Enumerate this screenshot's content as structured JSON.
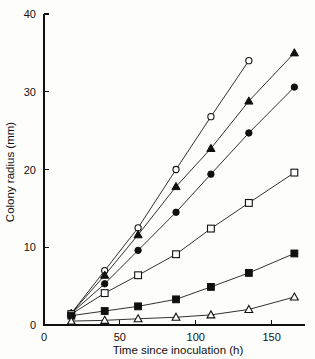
{
  "chart_data": {
    "type": "line",
    "title": "",
    "xlabel": "Time since inoculation (h)",
    "ylabel": "Colony radius (mm)",
    "xlim": [
      0,
      172
    ],
    "ylim": [
      0,
      40
    ],
    "xticks": [
      0,
      50,
      100,
      150
    ],
    "yticks": [
      0,
      10,
      20,
      30,
      40
    ],
    "grid": false,
    "legend": "none",
    "series": [
      {
        "name": "open-circle",
        "marker": "open-circle",
        "x": [
          18,
          40,
          62,
          87,
          110,
          135
        ],
        "y": [
          1.5,
          7.0,
          12.5,
          20.0,
          26.8,
          34.0
        ]
      },
      {
        "name": "filled-triangle",
        "marker": "filled-triangle",
        "x": [
          18,
          40,
          62,
          87,
          110,
          135,
          165
        ],
        "y": [
          1.5,
          6.4,
          11.6,
          17.8,
          22.7,
          28.8,
          35.0
        ]
      },
      {
        "name": "filled-circle",
        "marker": "filled-circle",
        "x": [
          18,
          40,
          62,
          87,
          110,
          135,
          165
        ],
        "y": [
          1.5,
          5.3,
          9.6,
          14.5,
          19.4,
          24.7,
          30.6
        ]
      },
      {
        "name": "open-square",
        "marker": "open-square",
        "x": [
          18,
          40,
          62,
          87,
          110,
          135,
          165
        ],
        "y": [
          1.4,
          4.1,
          6.4,
          9.1,
          12.4,
          15.7,
          19.6
        ]
      },
      {
        "name": "filled-square",
        "marker": "filled-square",
        "x": [
          18,
          40,
          62,
          87,
          110,
          135,
          165
        ],
        "y": [
          1.2,
          1.8,
          2.4,
          3.3,
          4.9,
          6.7,
          9.2
        ]
      },
      {
        "name": "open-triangle",
        "marker": "open-triangle",
        "x": [
          18,
          40,
          62,
          87,
          110,
          135,
          165
        ],
        "y": [
          0.5,
          0.6,
          0.8,
          1.0,
          1.3,
          2.0,
          3.6
        ]
      }
    ]
  },
  "axes": {
    "x_tick_labels": [
      "0",
      "50",
      "100",
      "150"
    ],
    "y_tick_labels": [
      "0",
      "10",
      "20",
      "30",
      "40"
    ],
    "x_title": "Time since inoculation (h)",
    "y_title": "Colony radius (mm)"
  }
}
